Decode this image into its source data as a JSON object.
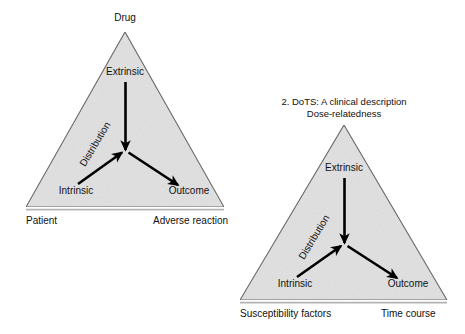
{
  "figure": {
    "background_color": "#ffffff",
    "triangle_fill": "#e3e3e3",
    "triangle_stroke": "#555555",
    "arrow_color": "#000000",
    "text_color": "#111111",
    "panels": [
      {
        "id": "panel-left",
        "apex_label": "Drug",
        "inner_top_label": "Extrinsic",
        "inner_left_label": "Intrinsic",
        "inner_right_label": "Outcome",
        "diagonal_label": "Distribution",
        "base_left_label": "Patient",
        "base_right_label": "Adverse reaction"
      },
      {
        "id": "panel-right",
        "title_line_1": "2. DoTS: A clinical description",
        "title_line_2": "Dose-relatedness",
        "inner_top_label": "Extrinsic",
        "inner_left_label": "Intrinsic",
        "inner_right_label": "Outcome",
        "diagonal_label": "Distribution",
        "base_left_label": "Susceptibility factors",
        "base_right_label": "Time course"
      }
    ]
  }
}
